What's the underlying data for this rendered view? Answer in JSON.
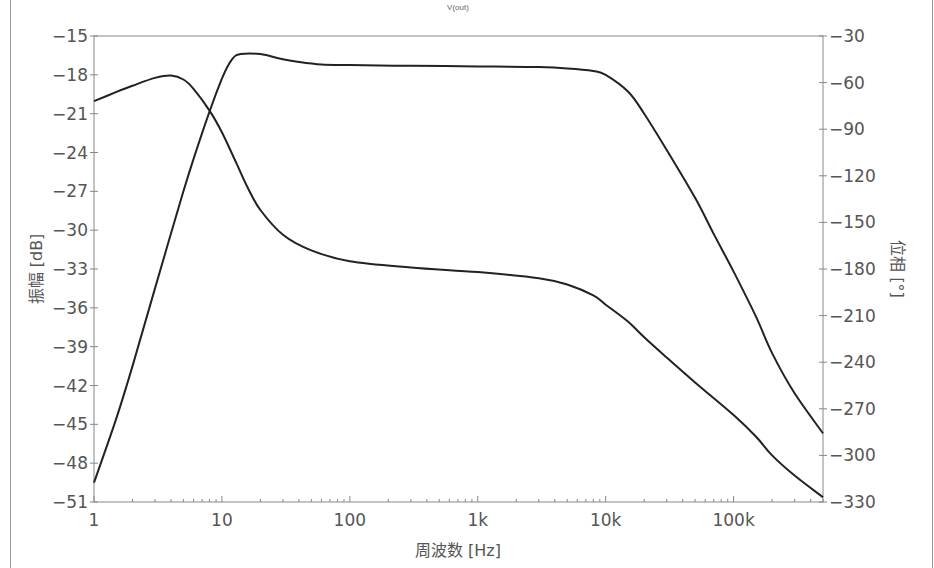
{
  "chart_data": {
    "type": "line",
    "title": "V(out)",
    "xlabel": "周波数 [Hz]",
    "ylabel": "振幅 [dB]",
    "y2label": "位相 [°]",
    "xscale": "log",
    "xlim": [
      1,
      500000
    ],
    "ylim": [
      -51,
      -15
    ],
    "y2lim": [
      -330,
      -30
    ],
    "grid": false,
    "legend": null,
    "x_ticks": [
      {
        "value": 1,
        "label": "1"
      },
      {
        "value": 10,
        "label": "10"
      },
      {
        "value": 100,
        "label": "100"
      },
      {
        "value": 1000,
        "label": "1k"
      },
      {
        "value": 10000,
        "label": "10k"
      },
      {
        "value": 100000,
        "label": "100k"
      }
    ],
    "y_ticks": [
      -15,
      -18,
      -21,
      -24,
      -27,
      -30,
      -33,
      -36,
      -39,
      -42,
      -45,
      -48,
      -51
    ],
    "y2_ticks": [
      -30,
      -60,
      -90,
      -120,
      -150,
      -180,
      -210,
      -240,
      -270,
      -300,
      -330
    ],
    "series": [
      {
        "name": "振幅",
        "axis": "left",
        "unit": "dB",
        "x": [
          1,
          1.5,
          2,
          3,
          5,
          7,
          10,
          12,
          14,
          20,
          30,
          40,
          60,
          100,
          300,
          1000,
          3000,
          5000,
          8000,
          10000,
          15000,
          20000,
          30000,
          50000,
          70000,
          100000,
          150000,
          200000,
          300000,
          500000
        ],
        "values": [
          -49.5,
          -44.5,
          -40.5,
          -34.5,
          -27.0,
          -22.5,
          -18.3,
          -16.8,
          -16.4,
          -16.4,
          -16.8,
          -17.0,
          -17.2,
          -17.25,
          -17.3,
          -17.35,
          -17.4,
          -17.5,
          -17.7,
          -18.0,
          -19.3,
          -21.0,
          -23.8,
          -27.5,
          -30.3,
          -33.2,
          -36.7,
          -39.5,
          -42.6,
          -45.7
        ]
      },
      {
        "name": "位相",
        "axis": "right",
        "unit": "deg",
        "x": [
          1,
          1.5,
          2,
          3,
          4,
          5,
          6,
          8,
          10,
          13,
          16,
          20,
          30,
          50,
          100,
          300,
          1000,
          3000,
          5000,
          8000,
          10000,
          15000,
          20000,
          30000,
          50000,
          100000,
          150000,
          200000,
          300000,
          500000
        ],
        "values": [
          -72,
          -66,
          -62,
          -57,
          -55.5,
          -58,
          -64,
          -78,
          -92,
          -112,
          -128,
          -142,
          -158,
          -168,
          -175,
          -179,
          -182,
          -186,
          -190,
          -197,
          -203,
          -214,
          -224,
          -237,
          -253,
          -274,
          -288,
          -300,
          -313,
          -327
        ]
      }
    ]
  }
}
